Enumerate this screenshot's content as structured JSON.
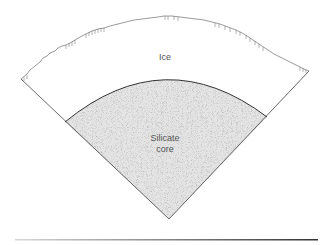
{
  "diagram": {
    "type": "planetary-interior-cross-section",
    "layers": [
      {
        "name": "Ice",
        "label": "Ice",
        "fill": "#ffffff"
      },
      {
        "name": "Silicate core",
        "label_line1": "Silicate",
        "label_line2": "core",
        "fill": "#e4e4e4"
      }
    ],
    "colors": {
      "outline": "#444444",
      "core_fill": "#e4e4e4",
      "text": "#555555"
    }
  }
}
